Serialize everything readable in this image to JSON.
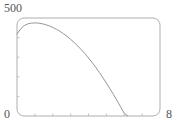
{
  "chart_data": {
    "type": "line",
    "title": "",
    "xlabel": "",
    "ylabel": "",
    "xlim": [
      0,
      8
    ],
    "ylim": [
      0,
      500
    ],
    "grid": false,
    "legend": null,
    "frame": true,
    "frame_rounded": true,
    "axis_tick_labels": {
      "y_max": "500",
      "origin": "0",
      "x_max": "8"
    },
    "x_ticks_major": [
      0,
      1,
      2,
      3,
      4,
      5,
      6,
      7,
      8
    ],
    "y_ticks_major": [
      0,
      100,
      200,
      300,
      400,
      500
    ],
    "series": [
      {
        "name": "curve",
        "color": "#8a8a8a",
        "x": [
          0.0,
          0.2,
          0.4,
          0.6,
          0.8,
          1.0,
          1.2,
          1.4,
          1.6,
          1.8,
          2.0,
          2.2,
          2.4,
          2.6,
          2.8,
          3.0,
          3.2,
          3.4,
          3.6,
          3.8,
          4.0,
          4.2,
          4.4,
          4.6,
          4.8,
          5.0,
          5.2,
          5.4,
          5.6,
          5.8,
          6.0,
          6.2,
          6.4,
          6.6,
          6.8,
          7.0
        ],
        "y": [
          418,
          444,
          461,
          470,
          474,
          475,
          474,
          471,
          466,
          460,
          452,
          443,
          432,
          420,
          406,
          391,
          375,
          357,
          338,
          318,
          296,
          273,
          249,
          223,
          196,
          168,
          139,
          109,
          78,
          46,
          14,
          0,
          0,
          0,
          0,
          0
        ]
      }
    ]
  },
  "plot_geometry": {
    "frame_left_px": 17,
    "frame_right_px": 160,
    "frame_top_px": 18,
    "frame_bottom_px": 116,
    "corner_radius_px": 7,
    "frame_color": "#9a9a9a",
    "curve_color": "#8a8a8a",
    "tick_color": "#aaaaaa"
  }
}
